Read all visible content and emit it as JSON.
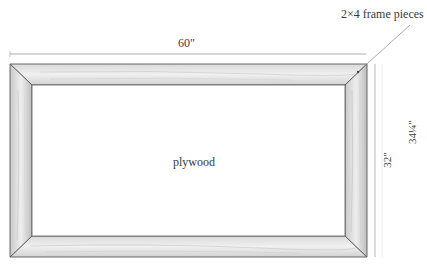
{
  "diagram": {
    "type": "frame-construction",
    "labels": {
      "callout": "2×4 frame pieces",
      "width_dim": "60\"",
      "inner_height_dim": "32\"",
      "outer_height_dim": "34¼\"",
      "center": "plywood"
    },
    "colors": {
      "wood_light": "#ececec",
      "wood_mid": "#d6d6d6",
      "wood_dark": "#b8b8b8",
      "outline": "#5a5a5a",
      "dim_line": "#9a9a9a",
      "background": "#ffffff"
    }
  }
}
